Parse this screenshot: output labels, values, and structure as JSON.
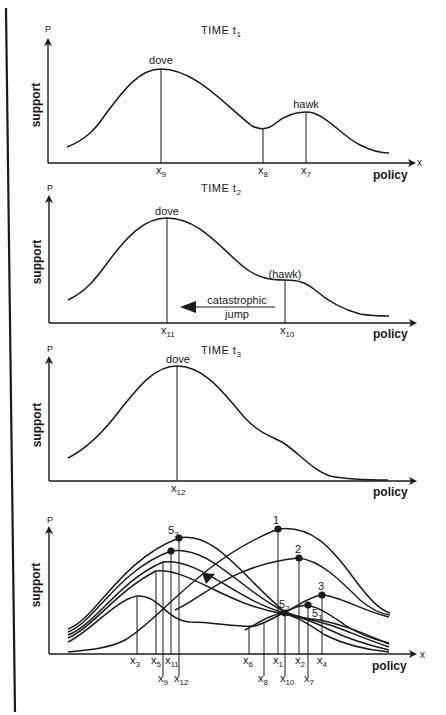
{
  "figure": {
    "left_border": true,
    "panels": [
      {
        "id": "t1",
        "title": "TIME t",
        "title_sub": "1",
        "y_axis_label": "support",
        "y_axis_symbol": "P",
        "x_axis_symbol": "x",
        "x_axis_label": "policy",
        "peak_labels": [
          "dove",
          "hawk"
        ],
        "ticks": [
          {
            "label": "x",
            "sub": "9"
          },
          {
            "label": "x",
            "sub": "8"
          },
          {
            "label": "x",
            "sub": "7"
          }
        ]
      },
      {
        "id": "t2",
        "title": "TIME t",
        "title_sub": "2",
        "y_axis_label": "support",
        "y_axis_symbol": "P",
        "x_axis_label": "policy",
        "peak_labels": [
          "dove",
          "(hawk)"
        ],
        "annotation": [
          "catastrophic",
          "jump"
        ],
        "ticks": [
          {
            "label": "x",
            "sub": "11"
          },
          {
            "label": "x",
            "sub": "10"
          }
        ]
      },
      {
        "id": "t3",
        "title": "TIME t",
        "title_sub": "3",
        "y_axis_label": "support",
        "y_axis_symbol": "P",
        "x_axis_label": "policy",
        "peak_labels": [
          "dove"
        ],
        "ticks": [
          {
            "label": "x",
            "sub": "12"
          }
        ]
      },
      {
        "id": "summary",
        "y_axis_label": "support",
        "y_axis_symbol": "P",
        "x_axis_symbol": "x",
        "x_axis_label": "policy",
        "point_labels": [
          {
            "label": "1",
            "sub": ""
          },
          {
            "label": "2",
            "sub": ""
          },
          {
            "label": "3",
            "sub": ""
          },
          {
            "label": "5",
            "sub": "1"
          },
          {
            "label": "5",
            "sub": "2"
          },
          {
            "label": "5",
            "sub": "3"
          }
        ],
        "ticks_upper": [
          {
            "label": "x",
            "sub": "3"
          },
          {
            "label": "x",
            "sub": "5"
          },
          {
            "label": "x",
            "sub": "11"
          },
          {
            "label": "x",
            "sub": "6"
          },
          {
            "label": "x",
            "sub": "1"
          },
          {
            "label": "x",
            "sub": "2"
          },
          {
            "label": "x",
            "sub": "4"
          }
        ],
        "ticks_lower": [
          {
            "label": "x",
            "sub": "9"
          },
          {
            "label": "x",
            "sub": "12"
          },
          {
            "label": "x",
            "sub": "8"
          },
          {
            "label": "x",
            "sub": "10"
          },
          {
            "label": "x",
            "sub": "7"
          }
        ]
      }
    ]
  }
}
